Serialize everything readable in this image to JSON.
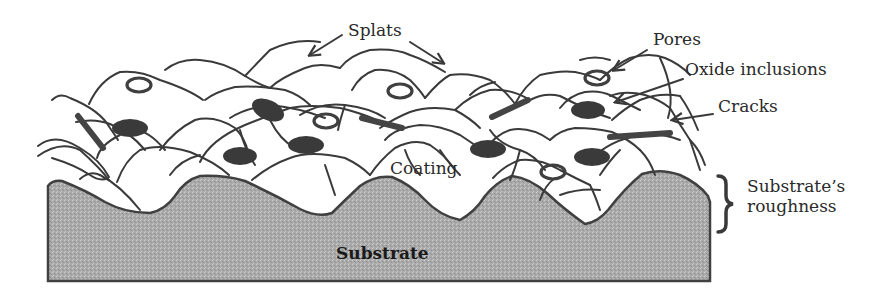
{
  "diagram": {
    "labels": {
      "splats": "Splats",
      "pores": "Pores",
      "oxide_inclusions": "Oxide inclusions",
      "cracks": "Cracks",
      "coating": "Coating",
      "substrate": "Substrate",
      "substrate_roughness": "Substrate’s\nroughness"
    },
    "features": {
      "pores_count": 5,
      "oxide_inclusions_count": 8,
      "crack_bars_count": 4
    },
    "colors": {
      "line": "#3a3a3a",
      "substrate_fill": "#a9a9a9",
      "background": "#ffffff"
    }
  }
}
